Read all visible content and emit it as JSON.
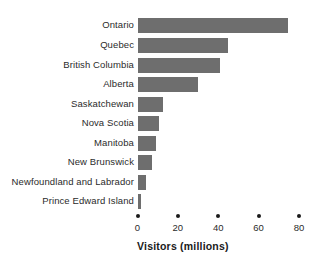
{
  "chart_data": {
    "type": "bar",
    "orientation": "horizontal",
    "title": "",
    "subtitle": "",
    "xlabel": "Visitors (millions)",
    "ylabel": "",
    "categories": [
      "Ontario",
      "Quebec",
      "British Columbia",
      "Alberta",
      "Saskatchewan",
      "Nova Scotia",
      "Manitoba",
      "New Brunswick",
      "Newfoundland and Labrador",
      "Prince Edward Island"
    ],
    "values": [
      74.5,
      45,
      41,
      30,
      12.5,
      10.5,
      9,
      7,
      4,
      1.5
    ],
    "xlim": [
      0,
      80
    ],
    "xticks": [
      0,
      20,
      40,
      60,
      80
    ],
    "xtick_labels": [
      "0",
      "20",
      "40",
      "60",
      "80"
    ],
    "grid": false,
    "legend": null,
    "bar_color": "#6e6e6e",
    "text_color": "#2b2b2b",
    "axis_color": "#1a1a1a",
    "background": "#ffffff"
  }
}
